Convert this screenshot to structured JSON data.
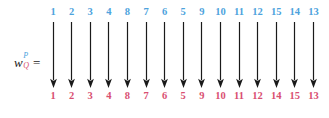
{
  "figure": {
    "label": {
      "variable": "w",
      "superscript": "P",
      "subscript": "Q",
      "equals": "="
    },
    "colors": {
      "top_row": "#4da3dd",
      "bottom_row": "#d94f72",
      "arrow": "#1a1a1a",
      "background": "#ffffff"
    },
    "columns": [
      {
        "top": "1",
        "bottom": "1"
      },
      {
        "top": "2",
        "bottom": "2"
      },
      {
        "top": "3",
        "bottom": "3"
      },
      {
        "top": "4",
        "bottom": "4"
      },
      {
        "top": "8",
        "bottom": "8"
      },
      {
        "top": "7",
        "bottom": "7"
      },
      {
        "top": "6",
        "bottom": "6"
      },
      {
        "top": "5",
        "bottom": "5"
      },
      {
        "top": "9",
        "bottom": "9"
      },
      {
        "top": "10",
        "bottom": "10"
      },
      {
        "top": "11",
        "bottom": "11"
      },
      {
        "top": "12",
        "bottom": "12"
      },
      {
        "top": "15",
        "bottom": "14"
      },
      {
        "top": "14",
        "bottom": "15"
      },
      {
        "top": "13",
        "bottom": "13"
      }
    ]
  }
}
